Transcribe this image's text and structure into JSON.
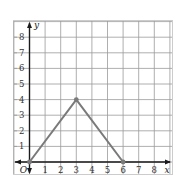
{
  "chart_data": {
    "type": "line",
    "title": "",
    "xlabel": "x",
    "ylabel": "y",
    "origin_label": "O",
    "xlim": [
      -1,
      9
    ],
    "ylim": [
      -0.75,
      8.9
    ],
    "grid": true,
    "x_ticks": [
      "1",
      "2",
      "3",
      "4",
      "5",
      "6",
      "7",
      "8"
    ],
    "y_ticks": [
      "1",
      "2",
      "3",
      "4",
      "5",
      "6",
      "7",
      "8"
    ],
    "series": [
      {
        "name": "triangle",
        "points": [
          [
            0,
            0
          ],
          [
            3,
            4
          ],
          [
            6,
            0
          ]
        ],
        "color": "#7a7a7a",
        "markers": true
      }
    ]
  },
  "colors": {
    "grid": "#9a9a9a",
    "axis": "#1a1a1a",
    "line": "#7a7a7a",
    "border": "#cccccc"
  }
}
